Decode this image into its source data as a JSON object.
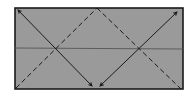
{
  "diagram": {
    "type": "origami-fold-instruction",
    "colors": {
      "background": "#ffffff",
      "paper_fill": "#9a9a9a",
      "line": "#1a1a1a",
      "crease": "#555555"
    },
    "paper": {
      "x": 15,
      "y": 8,
      "width": 168,
      "height": 81
    },
    "center_crease": {
      "x1": 15,
      "y1": 48,
      "x2": 183,
      "y2": 49
    },
    "valley_folds": [
      {
        "x1": 16,
        "y1": 88,
        "x2": 97,
        "y2": 8
      },
      {
        "x1": 97,
        "y1": 8,
        "x2": 181,
        "y2": 89
      }
    ],
    "fold_arrows": [
      {
        "from_x": 92,
        "from_y": 86,
        "to_x": 18,
        "to_y": 10
      },
      {
        "from_x": 100,
        "from_y": 86,
        "to_x": 177,
        "to_y": 12
      }
    ]
  }
}
